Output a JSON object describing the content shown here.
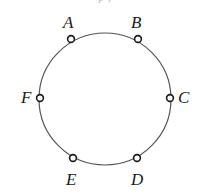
{
  "figure": {
    "type": "geometry-diagram",
    "cropped_caption_fragment": "p ,",
    "background_color": "#ffffff",
    "stroke_color": "#555555",
    "label_color": "#1a1a1a",
    "circle": {
      "center_x": 105,
      "center_y": 99,
      "radius": 66,
      "stroke_width": 1.2
    },
    "marker": {
      "shape": "open-circle",
      "radius": 3.4,
      "stroke_width": 1.6,
      "fill": "#ffffff"
    },
    "points": [
      {
        "label": "A",
        "marker_x": 71,
        "marker_y": 39,
        "label_x": 63,
        "label_y": 14,
        "angle_deg": 121
      },
      {
        "label": "B",
        "marker_x": 138,
        "marker_y": 39,
        "label_x": 131,
        "label_y": 14,
        "angle_deg": 59
      },
      {
        "label": "C",
        "marker_x": 170,
        "marker_y": 98,
        "label_x": 178,
        "label_y": 89,
        "angle_deg": 1
      },
      {
        "label": "D",
        "marker_x": 137,
        "marker_y": 158,
        "label_x": 131,
        "label_y": 171,
        "angle_deg": -60
      },
      {
        "label": "E",
        "marker_x": 73,
        "marker_y": 158,
        "label_x": 66,
        "label_y": 171,
        "angle_deg": -120
      },
      {
        "label": "F",
        "marker_x": 40,
        "marker_y": 98,
        "label_x": 21,
        "label_y": 89,
        "angle_deg": 179
      }
    ]
  }
}
